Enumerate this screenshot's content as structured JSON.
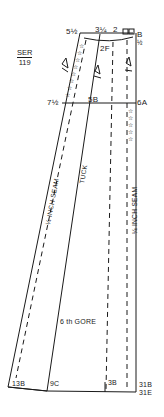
{
  "diagram": {
    "ref": {
      "top": "SER",
      "bottom": "119"
    },
    "labels": {
      "top_left": "5½",
      "top_mid": "3¼",
      "top_mid2": "2",
      "top_right": "B",
      "top_right_frac": "½",
      "dart": "2F",
      "mid_left": "7½",
      "mid_center": "5B",
      "mid_right": "6A",
      "seam_left": "¼ INCH SEAM",
      "tuck": "TUCK",
      "seam_right": "¼ INCH SEAM",
      "gore": "6 th GORE",
      "bottom_1": "13B",
      "bottom_2": "9C",
      "bottom_3": "3B",
      "bottom_4a": "31B",
      "bottom_4b": "31E"
    },
    "colors": {
      "ink": "#1a1a1a",
      "paper": "#ffffff"
    }
  }
}
